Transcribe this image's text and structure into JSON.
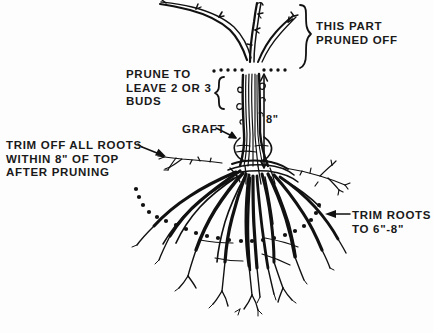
{
  "figure": {
    "background_color": "#fdfdfd",
    "ink_color": "#111111",
    "width": 433,
    "height": 333
  },
  "annotations": {
    "this_part_pruned_off": {
      "line1": "THIS PART",
      "line2": "PRUNED OFF"
    },
    "prune_to_leave_buds": {
      "line1": "PRUNE TO",
      "line2": "LEAVE 2 OR 3",
      "line3": "BUDS"
    },
    "graft": {
      "line1": "GRAFT"
    },
    "trim_off_all_roots": {
      "line1": "TRIM OFF ALL ROOTS",
      "line2": "WITHIN 8\" OF TOP",
      "line3": "AFTER PRUNING"
    },
    "trim_roots_to": {
      "line1": "TRIM ROOTS",
      "line2": "TO 6\"-8\""
    },
    "height_dimension": {
      "value": "8\""
    }
  },
  "icons": {
    "brace_right": "curly-brace-right",
    "brace_left": "curly-brace-left",
    "arrow_graft": "arrow-right",
    "arrow_trim_off": "arrow-right",
    "arrow_trim_roots": "arrow-left",
    "dimension_arrow": "double-headed-vertical-arrow",
    "cut_line_top": "dotted-cut-line",
    "cut_line_roots": "dotted-cut-curve"
  }
}
